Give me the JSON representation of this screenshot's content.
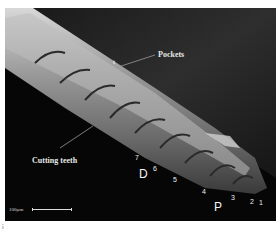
{
  "figure": {
    "kind": "SEM micrograph",
    "background_color": "#0c0c0c",
    "labels": {
      "pockets": "Pockets",
      "cutting_teeth": "Cutting teeth",
      "distal": "D",
      "proximal": "P",
      "marker_t": "t"
    },
    "teeth_numbers": [
      "7",
      "6",
      "5",
      "4",
      "3",
      "2",
      "1"
    ],
    "scale_bar": {
      "label": "100µm"
    },
    "corner_mark": "ⅰ"
  }
}
